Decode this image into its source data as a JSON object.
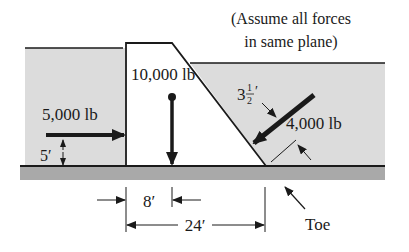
{
  "note": {
    "line1": "(Assume all forces",
    "line2": "in same plane)"
  },
  "forces": {
    "horizontal": {
      "label": "5,000 lb",
      "height_label": "5′"
    },
    "weight": {
      "label": "10,000 lb"
    },
    "inclined": {
      "label": "4,000 lb",
      "offset_whole": "3",
      "offset_num": "1",
      "offset_den": "2",
      "offset_unit": "′"
    }
  },
  "dimensions": {
    "inner": "8′",
    "outer": "24′"
  },
  "callouts": {
    "toe": "Toe"
  },
  "colors": {
    "water": "#dcdcdc",
    "ground": "#a9a9a9",
    "line": "#1a1a1a",
    "dam_fill": "#ffffff"
  }
}
